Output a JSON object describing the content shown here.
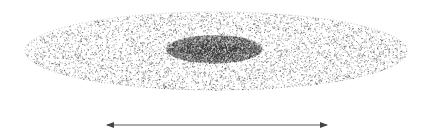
{
  "diagram": {
    "title": "",
    "background": "#ffffff",
    "disk": {
      "label": "",
      "cx": 216,
      "cy": 51,
      "rx": 191,
      "ry": 39,
      "dot_color": "#3a3a3a",
      "dot_count": 5200,
      "edge_color": "#7a7a7a"
    },
    "bulge": {
      "label": "",
      "cx": 214,
      "cy": 49,
      "rx": 48,
      "ry": 14,
      "dot_color": "#2a2a2a",
      "dot_count": 2600
    },
    "width_arrow": {
      "label": "",
      "x1": 107,
      "x2": 327,
      "y": 125,
      "color": "#555555"
    }
  }
}
